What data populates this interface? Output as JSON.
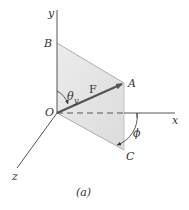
{
  "figure": {
    "caption": "(a)",
    "axes": {
      "x": "x",
      "y": "y",
      "z": "z"
    },
    "points": {
      "origin": "O",
      "A": "A",
      "B": "B",
      "C": "C"
    },
    "vector": {
      "label": "F"
    },
    "angles": {
      "theta": "θ",
      "theta_sub": "y",
      "phi": "ϕ"
    },
    "colors": {
      "plane_fill": "#e6e6e6",
      "axis": "#555555",
      "vector": "#555555",
      "text": "#333333"
    }
  }
}
